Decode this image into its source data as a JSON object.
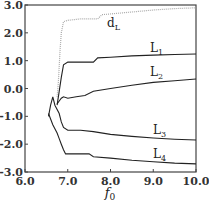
{
  "chart_data": {
    "type": "line",
    "title": "",
    "xlabel": "f0",
    "xlabel_main": "f",
    "xlabel_sub": "0",
    "ylabel": "",
    "xlim": [
      6.0,
      10.0
    ],
    "ylim": [
      -3.0,
      3.0
    ],
    "grid": false,
    "legend": "inline curve labels",
    "x_ticks": [
      "6.0",
      "7.0",
      "8.0",
      "9.0",
      "10.0"
    ],
    "y_ticks": [
      "3.0",
      "2.0",
      "1.0",
      "0.0",
      "-1.0",
      "-2.0",
      "-3.0"
    ],
    "series": [
      {
        "name": "dL",
        "label_main": "d",
        "label_sub": "L",
        "style": "dotted-gray",
        "color": "#aaaaaa",
        "points": [
          [
            6.75,
            -0.3
          ],
          [
            6.78,
            0.2
          ],
          [
            6.8,
            0.8
          ],
          [
            6.82,
            1.4
          ],
          [
            6.85,
            2.0
          ],
          [
            6.9,
            2.4
          ],
          [
            7.0,
            2.45
          ],
          [
            7.3,
            2.5
          ],
          [
            7.7,
            2.5
          ],
          [
            7.8,
            2.65
          ],
          [
            8.5,
            2.75
          ],
          [
            9.0,
            2.82
          ],
          [
            9.5,
            2.87
          ],
          [
            10.0,
            2.9
          ]
        ]
      },
      {
        "name": "L1",
        "label_main": "L",
        "label_sub": "1",
        "style": "solid",
        "color": "#222222",
        "points": [
          [
            6.75,
            -0.6
          ],
          [
            6.8,
            -0.1
          ],
          [
            6.85,
            0.4
          ],
          [
            6.9,
            0.85
          ],
          [
            7.0,
            0.95
          ],
          [
            7.3,
            0.95
          ],
          [
            7.6,
            0.95
          ],
          [
            7.7,
            1.1
          ],
          [
            8.0,
            1.12
          ],
          [
            8.5,
            1.17
          ],
          [
            9.0,
            1.2
          ],
          [
            9.5,
            1.22
          ],
          [
            10.0,
            1.24
          ]
        ]
      },
      {
        "name": "L2",
        "label_main": "L",
        "label_sub": "2",
        "style": "solid",
        "color": "#222222",
        "points": [
          [
            6.75,
            -0.55
          ],
          [
            6.8,
            -0.45
          ],
          [
            6.85,
            -0.35
          ],
          [
            6.9,
            -0.3
          ],
          [
            7.0,
            -0.35
          ],
          [
            7.2,
            -0.3
          ],
          [
            7.4,
            -0.25
          ],
          [
            7.6,
            -0.1
          ],
          [
            8.0,
            0.0
          ],
          [
            8.5,
            0.12
          ],
          [
            9.0,
            0.22
          ],
          [
            9.5,
            0.28
          ],
          [
            10.0,
            0.34
          ]
        ]
      },
      {
        "name": "L3",
        "label_main": "L",
        "label_sub": "3",
        "style": "solid",
        "color": "#222222",
        "points": [
          [
            6.55,
            -1.0
          ],
          [
            6.6,
            -0.6
          ],
          [
            6.65,
            -0.3
          ],
          [
            6.7,
            -0.6
          ],
          [
            6.8,
            -0.9
          ],
          [
            6.85,
            -1.2
          ],
          [
            6.9,
            -1.4
          ],
          [
            7.0,
            -1.5
          ],
          [
            7.3,
            -1.5
          ],
          [
            7.6,
            -1.55
          ],
          [
            8.0,
            -1.65
          ],
          [
            8.5,
            -1.72
          ],
          [
            9.0,
            -1.78
          ],
          [
            9.5,
            -1.82
          ],
          [
            10.0,
            -1.85
          ]
        ]
      },
      {
        "name": "L4",
        "label_main": "L",
        "label_sub": "4",
        "style": "solid",
        "color": "#222222",
        "points": [
          [
            6.55,
            -0.9
          ],
          [
            6.65,
            -1.3
          ],
          [
            6.75,
            -1.6
          ],
          [
            6.8,
            -1.8
          ],
          [
            6.85,
            -2.0
          ],
          [
            6.9,
            -2.2
          ],
          [
            6.95,
            -2.35
          ],
          [
            7.2,
            -2.35
          ],
          [
            7.5,
            -2.35
          ],
          [
            7.6,
            -2.45
          ],
          [
            8.0,
            -2.5
          ],
          [
            8.5,
            -2.58
          ],
          [
            9.0,
            -2.63
          ],
          [
            9.5,
            -2.68
          ],
          [
            10.0,
            -2.71
          ]
        ]
      }
    ]
  }
}
